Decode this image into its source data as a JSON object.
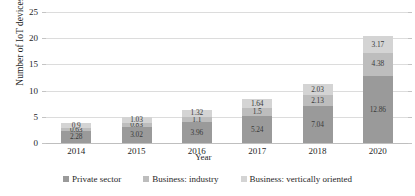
{
  "chart_data": {
    "type": "bar",
    "subtype": "stacked-bar",
    "title": "",
    "xlabel": "Year",
    "ylabel": "Number of IoT devices (billions)",
    "categories": [
      "2014",
      "2015",
      "2016",
      "2017",
      "2018",
      "2020"
    ],
    "ylim": [
      0,
      25
    ],
    "yticks": [
      "0",
      "5",
      "10",
      "15",
      "20",
      "25"
    ],
    "grid": true,
    "legend_position": "bottom",
    "series": [
      {
        "name": "Private sector",
        "color": "#9a9a9a",
        "values": [
          2.28,
          3.02,
          3.96,
          5.24,
          7.04,
          12.86
        ],
        "labels": [
          "2.28",
          "3.02",
          "3.96",
          "5.24",
          "7.04",
          "12.86"
        ]
      },
      {
        "name": "Business: industry",
        "color": "#bdbdbd",
        "values": [
          0.63,
          0.83,
          1.1,
          1.5,
          2.13,
          4.38
        ],
        "labels": [
          "0.63",
          "0.83",
          "1.1",
          "1.5",
          "2.13",
          "4.38"
        ]
      },
      {
        "name": "Business: vertically oriented",
        "color": "#d4d4d4",
        "values": [
          0.9,
          1.03,
          1.32,
          1.64,
          2.03,
          3.17
        ],
        "labels": [
          "0.9",
          "1.03",
          "1.32",
          "1.64",
          "2.03",
          "3.17"
        ]
      }
    ],
    "totals": [
      3.81,
      4.88,
      6.38,
      8.38,
      11.2,
      20.41
    ]
  },
  "colors": {
    "gridline": "#dcdcdc",
    "axis": "#bfbfbf",
    "text": "#1f1f1f",
    "background": "#ffffff"
  }
}
